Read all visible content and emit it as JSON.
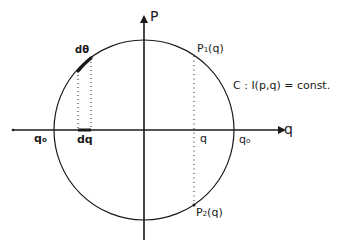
{
  "diagram": {
    "type": "phase-space-orbit",
    "colors": {
      "ink": "#1a1a1a",
      "background": "#ffffff"
    },
    "axes": {
      "horizontal": {
        "label": "q"
      },
      "vertical": {
        "label": "P"
      }
    },
    "curve": {
      "shape": "circle",
      "caption": "C : I(p,q) = const."
    },
    "labels": {
      "q0_left": "q",
      "q0_left_sub": "o",
      "q0_right": "q",
      "q0_right_sub": "o",
      "dq": "dq",
      "d_theta": "dθ",
      "q_point": "q",
      "p1": "P",
      "p1_sub": "1",
      "p1_arg": "(q)",
      "p2": "P",
      "p2_sub": "2",
      "p2_arg": "(q)"
    }
  }
}
